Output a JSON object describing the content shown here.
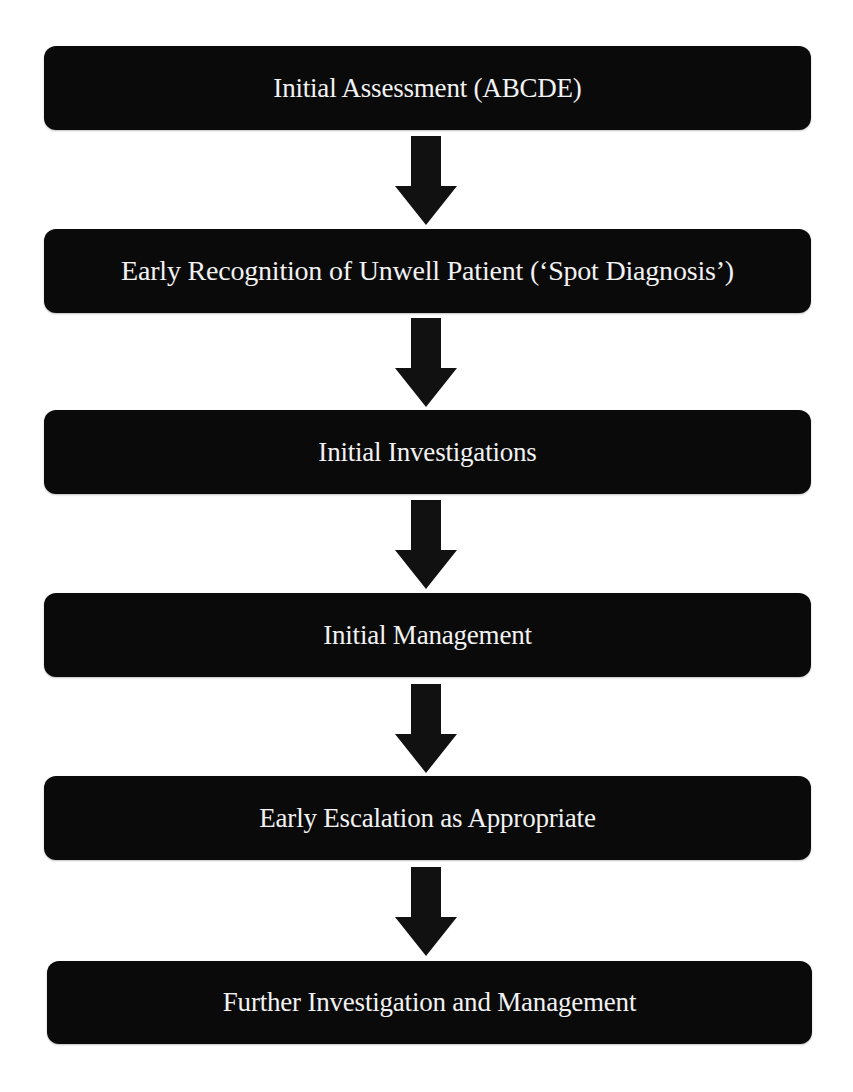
{
  "diagram": {
    "type": "flowchart",
    "direction": "top-to-bottom",
    "colors": {
      "box_fill": "#0a0a0a",
      "box_text": "#f2f2f2",
      "arrow": "#111111",
      "background": "#ffffff"
    },
    "steps": [
      {
        "label": "Initial Assessment (ABCDE)"
      },
      {
        "label": "Early Recognition of Unwell Patient (‘Spot Diagnosis’)"
      },
      {
        "label": "Initial Investigations"
      },
      {
        "label": "Initial Management"
      },
      {
        "label": "Early Escalation as Appropriate"
      },
      {
        "label": "Further Investigation and Management"
      }
    ],
    "connectors": [
      {
        "from": 0,
        "to": 1,
        "icon": "down-arrow-icon"
      },
      {
        "from": 1,
        "to": 2,
        "icon": "down-arrow-icon"
      },
      {
        "from": 2,
        "to": 3,
        "icon": "down-arrow-icon"
      },
      {
        "from": 3,
        "to": 4,
        "icon": "down-arrow-icon"
      },
      {
        "from": 4,
        "to": 5,
        "icon": "down-arrow-icon"
      }
    ]
  }
}
